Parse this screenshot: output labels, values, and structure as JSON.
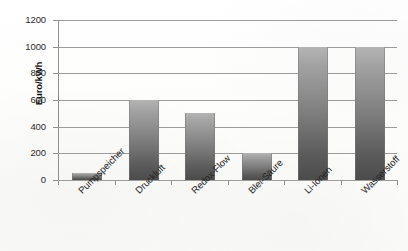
{
  "chart_data": {
    "type": "bar",
    "title": "",
    "subtitle": "",
    "xlabel": "",
    "ylabel": "Euro/kWh",
    "categories": [
      "Pumpspeicher",
      "Druckluft",
      "Redox-Flow",
      "Blei-Säure",
      "Li-Ionen",
      "Wasserstoff"
    ],
    "values": [
      50,
      600,
      500,
      200,
      1000,
      1000
    ],
    "ylim": [
      0,
      1200
    ],
    "ytick_step": 200,
    "ytick_labels": [
      "0",
      "200",
      "400",
      "600",
      "800",
      "1000",
      "1200"
    ],
    "grid": true,
    "grid_axis": "y",
    "legend": "none",
    "bar_fill_top_color": "#b4b4b4",
    "bar_fill_bottom_color": "#4b4b4b",
    "gridline_color": "#9c9c9c",
    "axis_color": "#8f8f8f",
    "background_color": "#fdfdfd",
    "xtick_label_rotation": -45
  }
}
